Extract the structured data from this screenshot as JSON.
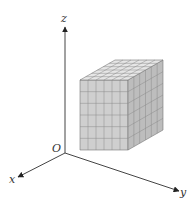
{
  "diagram": {
    "axes": {
      "x_label": "x",
      "y_label": "y",
      "z_label": "z",
      "origin_label": "O"
    },
    "cube": {
      "grid_size": 6,
      "description": "6 x 6 x 6 cube composed of small unit cubes"
    },
    "colors": {
      "axis": "#444444",
      "front_face": "#cfcfcf",
      "right_face": "#bdbdbd",
      "top_face": "#e6e6e6",
      "grid_line": "#8a8a8a",
      "edge": "#777777"
    }
  }
}
